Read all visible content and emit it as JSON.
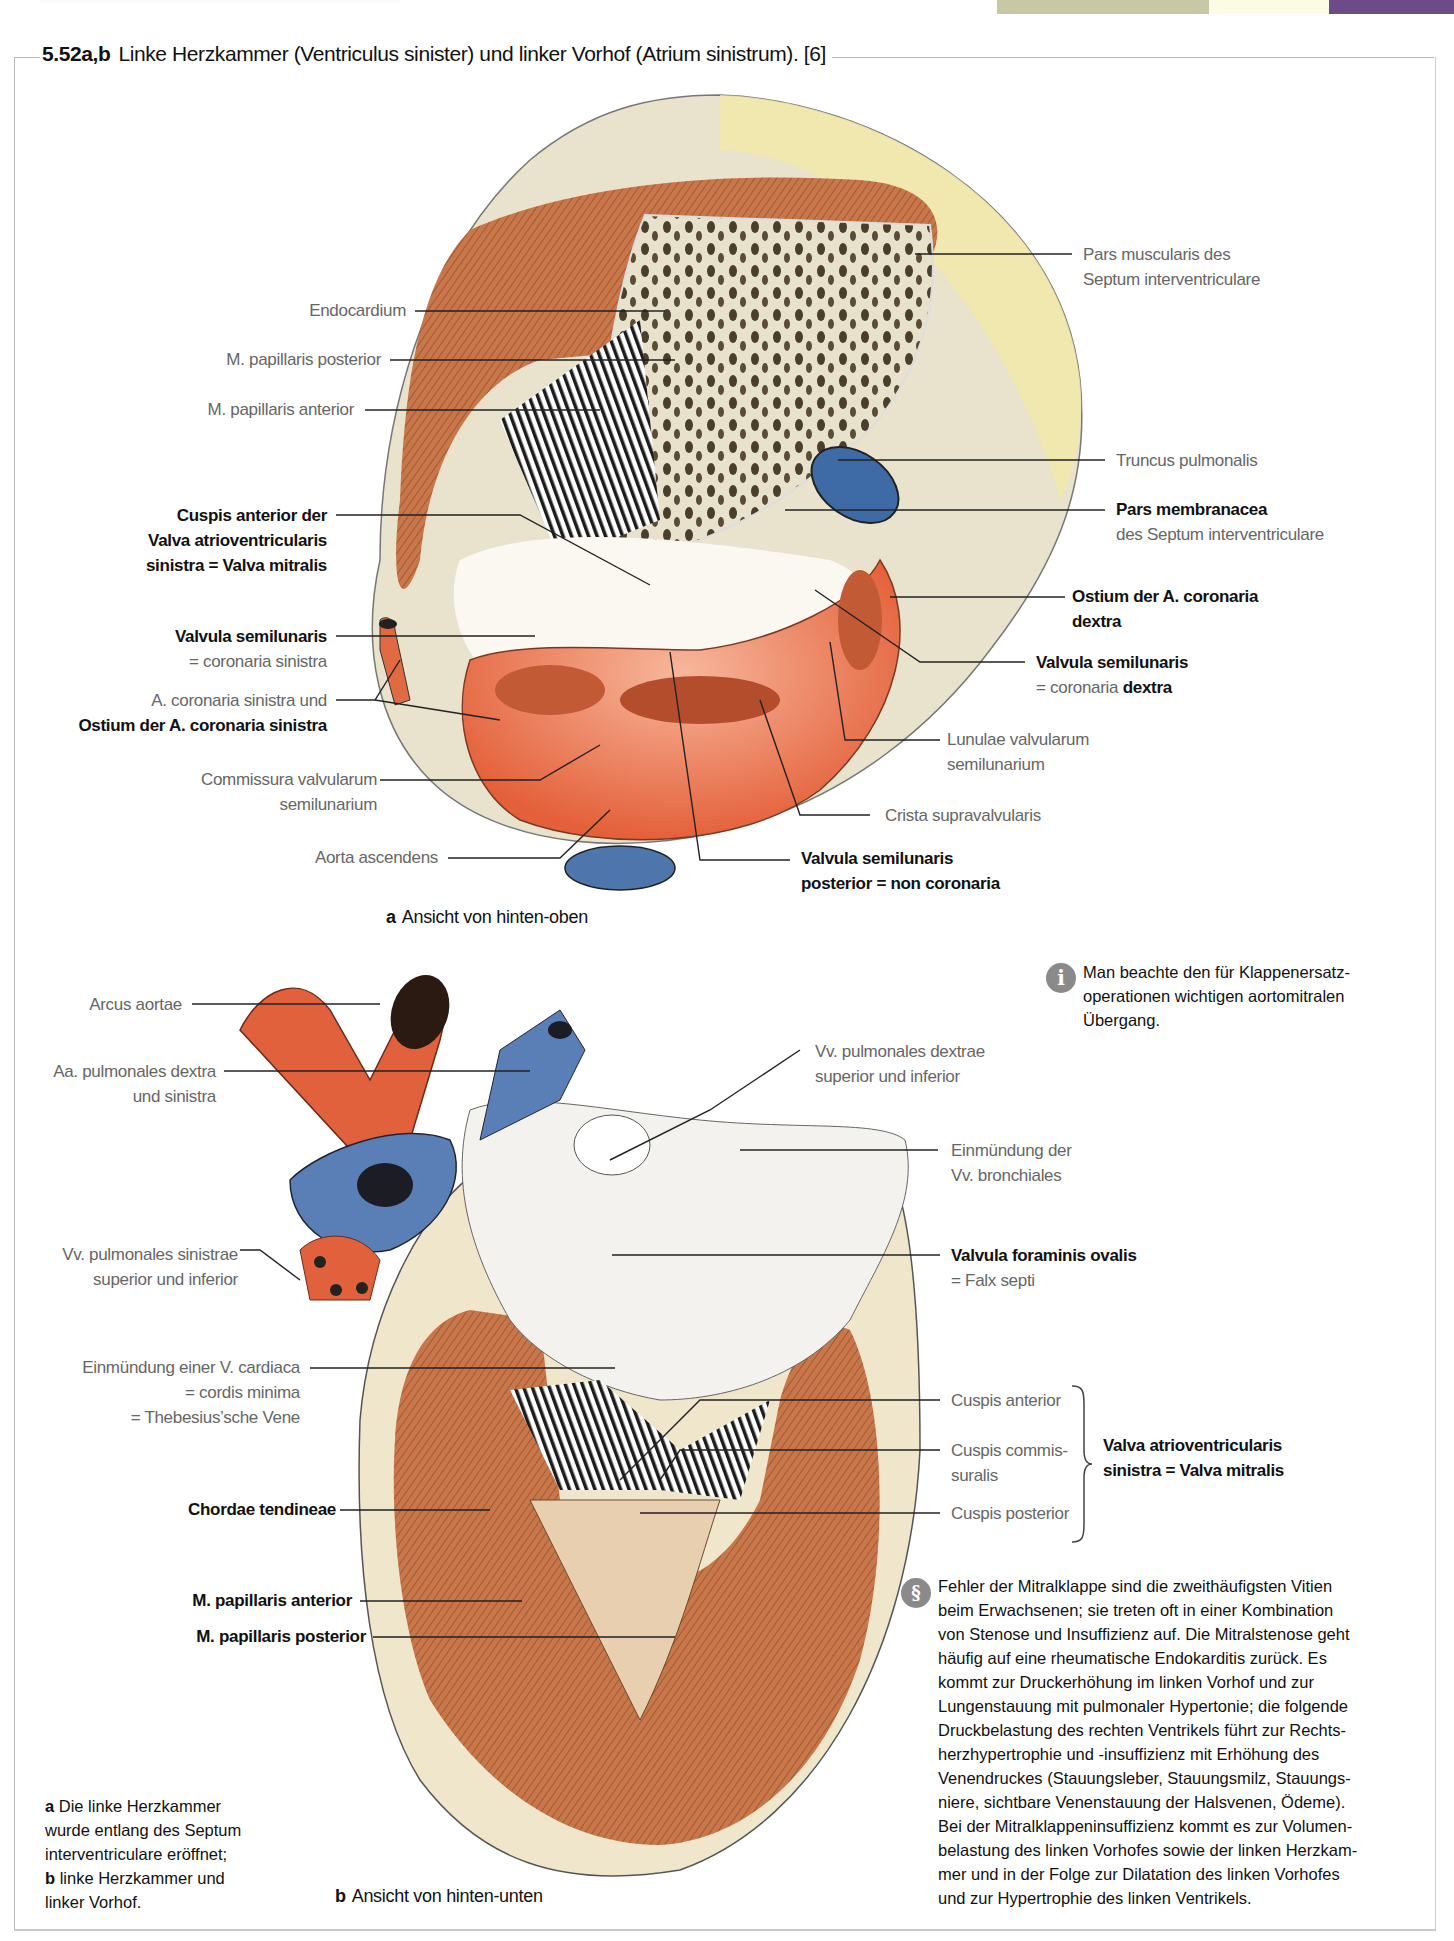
{
  "page_header": {
    "partial_heading_visible": true,
    "swatches": [
      "#c9c8a4",
      "#fbfbe6",
      "#6b4c86"
    ]
  },
  "figure": {
    "number": "5.52a,b",
    "title": "Linke Herzkammer (Ventriculus sinister) und linker Vorhof (Atrium sinistrum). [6]"
  },
  "panel_a": {
    "caption_letter": "a",
    "caption": "Ansicht von hinten-oben",
    "labels_left": [
      {
        "text": "Endocardium",
        "bold": false
      },
      {
        "text": "M. papillaris posterior",
        "bold": false
      },
      {
        "text": "M. papillaris anterior",
        "bold": false
      },
      {
        "line1": "Cuspis anterior der",
        "line2": "Valva atrioventricularis",
        "line3": "sinistra = Valva mitralis",
        "bold": true
      },
      {
        "line1": "Valvula semilunaris",
        "line2": "= coronaria sinistra",
        "bold_line1": true
      },
      {
        "line1": "A. coronaria sinistra und",
        "line2": "Ostium der A. coronaria sinistra",
        "bold_line2": true
      },
      {
        "line1": "Commissura valvularum",
        "line2": "semilunarium",
        "bold": false
      },
      {
        "text": "Aorta ascendens",
        "bold": false
      }
    ],
    "labels_right": [
      {
        "line1": "Pars muscularis des",
        "line2": "Septum interventriculare",
        "bold": false
      },
      {
        "text": "Truncus pulmonalis",
        "bold": false
      },
      {
        "line1": "Pars membranacea",
        "line2": "des Septum interventriculare",
        "bold_line1": true
      },
      {
        "line1": "Ostium der A. coronaria",
        "line2": "dextra",
        "bold": true
      },
      {
        "line1": "Valvula semilunaris",
        "line2_prefix": "= coronaria",
        "line2_bold": "dextra",
        "bold_line1": true
      },
      {
        "line1": "Lunulae valvularum",
        "line2": "semilunarium",
        "bold": false
      },
      {
        "text": "Crista supravalvularis",
        "bold": false
      },
      {
        "line1": "Valvula semilunaris",
        "line2": "posterior = non coronaria",
        "bold": true
      }
    ]
  },
  "panel_b": {
    "caption_letter": "b",
    "caption": "Ansicht von hinten-unten",
    "labels_left": [
      {
        "text": "Arcus aortae",
        "bold": false
      },
      {
        "line1": "Aa. pulmonales dextra",
        "line2": "und sinistra",
        "bold": false
      },
      {
        "line1": "Vv. pulmonales sinistrae",
        "line2": "superior und inferior",
        "bold": false
      },
      {
        "line1": "Einmündung einer V. cardiaca",
        "line2": "= cordis minima",
        "line3": "= Thebesius’sche Vene",
        "bold": false
      },
      {
        "text": "Chordae tendineae",
        "bold": true
      },
      {
        "text": "M. papillaris anterior",
        "bold": true
      },
      {
        "text": "M. papillaris posterior",
        "bold": true
      }
    ],
    "labels_right": [
      {
        "line1": "Vv. pulmonales dextrae",
        "line2": "superior und inferior",
        "bold": false
      },
      {
        "line1": "Einmündung der",
        "line2": "Vv. bronchiales",
        "bold": false
      },
      {
        "line1": "Valvula foraminis ovalis",
        "line2": "= Falx septi",
        "bold_line1": true
      },
      {
        "text": "Cuspis anterior",
        "bold": false
      },
      {
        "line1": "Cuspis commis-",
        "line2": "suralis",
        "bold": false
      },
      {
        "text": "Cuspis posterior",
        "bold": false
      }
    ],
    "brace_label": {
      "line1": "Valva atrioventricularis",
      "line2": "sinistra = Valva mitralis"
    }
  },
  "info_note": {
    "icon": "info-icon",
    "lines": [
      "Man beachte den für Klappenersatz-",
      "operationen wichtigen aortomitralen",
      "Übergang."
    ]
  },
  "clinical_note": {
    "icon": "caduceus-icon",
    "lines": [
      "Fehler der Mitralklappe sind die zweithäufigsten Vitien",
      "beim Erwachsenen; sie treten oft in einer Kombination",
      "von Stenose und Insuffizienz auf. Die Mitralstenose geht",
      "häufig auf eine rheumatische Endokarditis zurück. Es",
      "kommt zur Druckerhöhung im linken Vorhof und zur",
      "Lungenstauung mit pulmonaler Hypertonie; die folgende",
      "Druckbelastung des rechten Ventrikels führt zur Rechts-",
      "herzhypertrophie und -insuffizienz mit Erhöhung des",
      "Venendruckes (Stauungsleber, Stauungsmilz, Stauungs-",
      "niere, sichtbare Venenstauung der Halsvenen, Ödeme).",
      "Bei der Mitralklappeninsuffizienz kommt es zur Volumen-",
      "belastung des linken Vorhofes sowie der linken Herzkam-",
      "mer und in der Folge zur Dilatation des linken Vorhofes",
      "und zur Hypertrophie des linken Ventrikels."
    ]
  },
  "legend": {
    "a_letter": "a",
    "a_text_1": "Die linke Herzkammer",
    "a_text_2": "wurde entlang des Septum",
    "a_text_3": "interventriculare eröffnet;",
    "b_letter": "b",
    "b_text_1": "linke Herzkammer und",
    "b_text_2": "linker Vorhof."
  },
  "colors": {
    "muscle": "#c8764a",
    "artery": "#e0603e",
    "vein": "#5a7db3",
    "fat": "#f1e59a",
    "tissue": "#efe9d6"
  }
}
